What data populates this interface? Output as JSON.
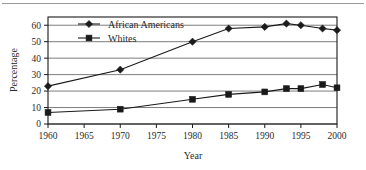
{
  "figure": {
    "background_color": "#ffffff",
    "line_color": "#1a1a1a",
    "grid_color": "#6e6e6e",
    "frame_color": "#1a1a1a",
    "top_rule_color": "#9a9a9a"
  },
  "chart_data": {
    "type": "line",
    "title": "",
    "xlabel": "Year",
    "ylabel": "Percentage",
    "x": [
      1960,
      1970,
      1980,
      1985,
      1990,
      1993,
      1995,
      1998,
      2000
    ],
    "xlim": [
      1960,
      2000
    ],
    "ylim": [
      0,
      65
    ],
    "xticks": [
      1960,
      1965,
      1970,
      1975,
      1980,
      1985,
      1990,
      1995,
      2000
    ],
    "xtick_labels": [
      "1960",
      "1965",
      "1970",
      "1975",
      "1980",
      "1985",
      "1990",
      "1995",
      "2000"
    ],
    "yticks": [
      0,
      10,
      20,
      30,
      40,
      50,
      60
    ],
    "ytick_labels": [
      "0",
      "10",
      "20",
      "30",
      "40",
      "50",
      "60"
    ],
    "grid": "horizontal",
    "legend_position": "top-left-inside",
    "series": [
      {
        "name": "African Americans",
        "marker": "diamond",
        "color": "#1a1a1a",
        "x": [
          1960,
          1970,
          1980,
          1985,
          1990,
          1993,
          1995,
          1998,
          2000
        ],
        "values": [
          23,
          33,
          50,
          58,
          59,
          61,
          60,
          58,
          57
        ]
      },
      {
        "name": "Whites",
        "marker": "square",
        "color": "#1a1a1a",
        "x": [
          1960,
          1970,
          1980,
          1985,
          1990,
          1993,
          1995,
          1998,
          2000
        ],
        "values": [
          7,
          9,
          15,
          18,
          19.5,
          21.5,
          21.5,
          24,
          22
        ]
      }
    ]
  }
}
